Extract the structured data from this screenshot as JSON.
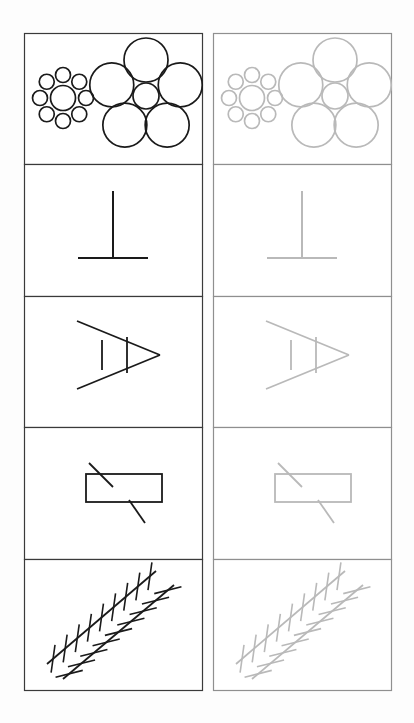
{
  "document": {
    "title": "Visual Illusion Figure Sheet",
    "background_color": "#fdfdfd",
    "panel_fill": "#ffffff",
    "width": 414,
    "height": 723
  },
  "columns": [
    {
      "id": "left-column",
      "label": "Left column",
      "contrast": "high",
      "stroke_color": "#1a1a1a",
      "frame_color": "#3a3a3a",
      "x": 24,
      "width": 178
    },
    {
      "id": "right-column",
      "label": "Right column",
      "contrast": "low",
      "stroke_color": "#b9b9b9",
      "frame_color": "#8f8f8f",
      "x": 213,
      "width": 178
    }
  ],
  "grid": {
    "rows": 5,
    "cols": 2,
    "top": 33,
    "row_height": 131.4,
    "row_tops": [
      33,
      164,
      296,
      427,
      559
    ],
    "row_bottoms": [
      164,
      296,
      427,
      559,
      690
    ]
  },
  "rows": [
    {
      "index": 1,
      "name": "ebbinghaus-row",
      "illusion_name": "Ebbinghaus (Titchener circles)",
      "figure": "two-circle-clusters",
      "clusters": [
        {
          "name": "small-surround-cluster",
          "center": [
            63,
            98
          ],
          "center_circle_radius": 12.5,
          "satellite_radius": 7.5,
          "satellite_orbit_radius": 23,
          "satellite_count": 8,
          "satellite_start_angle": -90
        },
        {
          "name": "large-surround-cluster",
          "center": [
            146,
            96
          ],
          "center_circle_radius": 13,
          "satellite_radius": 22,
          "satellite_orbit_radius": 36,
          "satellite_count": 5,
          "satellite_start_angle": -90
        }
      ]
    },
    {
      "index": 2,
      "name": "vertical-horizontal-row",
      "illusion_name": "Vertical-horizontal (inverted T)",
      "figure": "inverted-t",
      "vertical": {
        "x": 113,
        "y1": 191,
        "y2": 258
      },
      "horizontal": {
        "y": 258,
        "x1": 78,
        "x2": 148
      }
    },
    {
      "index": 3,
      "name": "ponzo-row",
      "illusion_name": "Ponzo converging lines",
      "figure": "converging-wedge-with-bars",
      "apex": [
        160,
        355
      ],
      "upper_ray_end": [
        77,
        321
      ],
      "lower_ray_end": [
        77,
        389
      ],
      "free_bar": {
        "x": 102,
        "y1": 340,
        "y2": 370
      },
      "attached_bar": {
        "x": 127,
        "y1": 337,
        "y2": 373
      }
    },
    {
      "index": 4,
      "name": "poggendorff-row",
      "illusion_name": "Poggendorff",
      "figure": "rectangle-with-interrupted-diagonal",
      "rectangle": {
        "x": 86,
        "y": 474,
        "width": 76,
        "height": 28
      },
      "diagonal_upper": {
        "x1": 89,
        "y1": 463,
        "x2": 113,
        "y2": 487
      },
      "diagonal_lower": {
        "x1": 129,
        "y1": 500,
        "x2": 145,
        "y2": 523
      }
    },
    {
      "index": 5,
      "name": "zollner-row",
      "illusion_name": "Zöllner",
      "figure": "two-hatched-parallel-diagonals",
      "lines": [
        {
          "name": "upper-diagonal",
          "x1": 47,
          "y1": 664,
          "x2": 156,
          "y2": 571,
          "hatch_count": 9,
          "hatch_angle_deg": 82,
          "hatch_length": 28
        },
        {
          "name": "lower-diagonal",
          "x1": 63,
          "y1": 679,
          "x2": 174,
          "y2": 585,
          "hatch_count": 9,
          "hatch_angle_deg": 14,
          "hatch_length": 28
        }
      ]
    }
  ],
  "stroke_widths": {
    "frame": 1.2,
    "ebbinghaus": 1.7,
    "inverted_t": 2.0,
    "ponzo": 1.8,
    "poggendorff": 1.8,
    "zollner_main": 1.8,
    "zollner_hatch": 1.6
  }
}
